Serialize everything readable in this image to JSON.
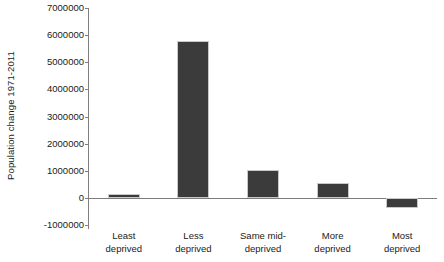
{
  "chart_data": {
    "type": "bar",
    "title": "",
    "xlabel": "",
    "ylabel": "Population change 1971-2011",
    "categories": [
      "Least deprived",
      "Less deprived",
      "Same mid-deprived",
      "More deprived",
      "Most deprived"
    ],
    "category_lines": [
      [
        "Least",
        "deprived"
      ],
      [
        "Less",
        "deprived"
      ],
      [
        "Same mid-",
        "deprived"
      ],
      [
        "More",
        "deprived"
      ],
      [
        "Most",
        "deprived"
      ]
    ],
    "values": [
      150000,
      5800000,
      1050000,
      550000,
      -350000
    ],
    "ylim": [
      -1000000,
      7000000
    ],
    "ytick_values": [
      7000000,
      6000000,
      5000000,
      4000000,
      3000000,
      2000000,
      1000000,
      0,
      -1000000
    ],
    "ytick_labels": [
      "7000000",
      "6000000",
      "5000000",
      "4000000",
      "3000000",
      "2000000",
      "1000000",
      "0",
      "-1000000"
    ],
    "grid": false,
    "legend": "none",
    "bar_color": "#3b3b3b",
    "bar_border_color": "#c9c9c9",
    "axis_color": "#808080",
    "background_color": "#ffffff"
  }
}
